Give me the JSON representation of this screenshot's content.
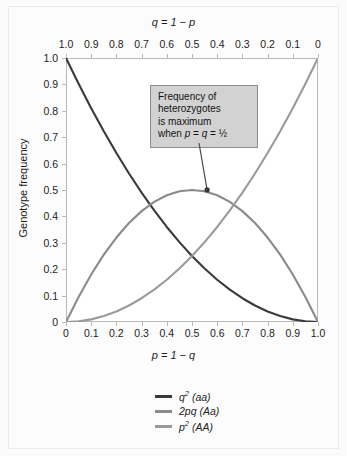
{
  "chart_data": {
    "type": "line",
    "title": "",
    "xlabel": "p = 1 − q",
    "ylabel": "Genotype frequency",
    "top_axis_label": "q = 1 − p",
    "xlim": [
      0,
      1
    ],
    "ylim": [
      0,
      1
    ],
    "grid": false,
    "legend_position": "below-plot",
    "x": [
      0,
      0.05,
      0.1,
      0.15,
      0.2,
      0.25,
      0.3,
      0.35,
      0.4,
      0.45,
      0.5,
      0.55,
      0.6,
      0.65,
      0.7,
      0.75,
      0.8,
      0.85,
      0.9,
      0.95,
      1.0
    ],
    "series": [
      {
        "name": "q2 (aa)",
        "color": "#3a3a3a",
        "values": [
          1.0,
          0.9025,
          0.81,
          0.7225,
          0.64,
          0.5625,
          0.49,
          0.4225,
          0.36,
          0.3025,
          0.25,
          0.2025,
          0.16,
          0.1225,
          0.09,
          0.0625,
          0.04,
          0.0225,
          0.01,
          0.0025,
          0.0
        ]
      },
      {
        "name": "2pq (Aa)",
        "color": "#8a8a8a",
        "values": [
          0.0,
          0.095,
          0.18,
          0.255,
          0.32,
          0.375,
          0.42,
          0.455,
          0.48,
          0.495,
          0.5,
          0.495,
          0.48,
          0.455,
          0.42,
          0.375,
          0.32,
          0.255,
          0.18,
          0.095,
          0.0
        ]
      },
      {
        "name": "p2 (AA)",
        "color": "#9a9a9a",
        "values": [
          0.0,
          0.0025,
          0.01,
          0.0225,
          0.04,
          0.0625,
          0.09,
          0.1225,
          0.16,
          0.2025,
          0.25,
          0.3025,
          0.36,
          0.4225,
          0.49,
          0.5625,
          0.64,
          0.7225,
          0.81,
          0.9025,
          1.0
        ]
      }
    ],
    "x_ticks_bottom": [
      "0",
      "0.1",
      "0.2",
      "0.3",
      "0.4",
      "0.5",
      "0.6",
      "0.7",
      "0.8",
      "0.9",
      "1.0"
    ],
    "x_ticks_top": [
      "1.0",
      "0.9",
      "0.8",
      "0.7",
      "0.6",
      "0.5",
      "0.4",
      "0.3",
      "0.2",
      "0.1",
      "0"
    ],
    "y_ticks": [
      "1.0",
      "0.9",
      "0.8",
      "0.7",
      "0.6",
      "0.5",
      "0.4",
      "0.3",
      "0.2",
      "0.1",
      "0"
    ],
    "annotations": [
      {
        "text_lines": [
          "Frequency of",
          "heterozygotes",
          "is maximum",
          "when p = q = ½"
        ],
        "points_to_x": 0.56,
        "points_to_y": 0.4928
      }
    ]
  },
  "axes": {
    "top_title": "q = 1 − p",
    "bottom_title": "p = 1 − q",
    "y_title": "Genotype frequency"
  },
  "callout": {
    "line1": "Frequency of",
    "line2": "heterozygotes",
    "line3": "is maximum",
    "line4_prefix": "when ",
    "line4_p": "p",
    "line4_eq1": " = ",
    "line4_q": "q",
    "line4_eq2": " = ",
    "line4_half": "½"
  },
  "legend": {
    "items": [
      {
        "base": "q",
        "exp": "2",
        "genotype": " (aa)",
        "color": "#3a3a3a"
      },
      {
        "base": "2pq",
        "exp": "",
        "genotype": " (Aa)",
        "color": "#8a8a8a"
      },
      {
        "base": "p",
        "exp": "2",
        "genotype": " (AA)",
        "color": "#9a9a9a"
      }
    ]
  }
}
